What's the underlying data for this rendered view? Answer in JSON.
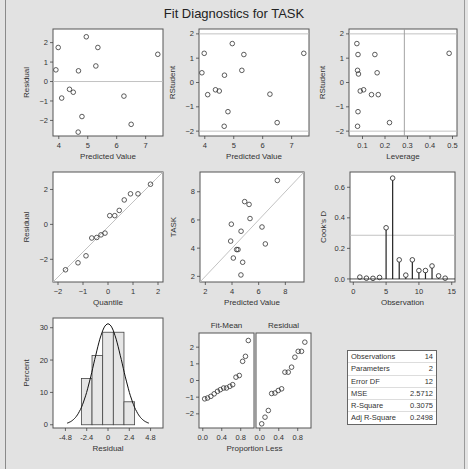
{
  "title": "Fit Diagnostics for TASK",
  "colors": {
    "background": "#e3e3e3",
    "plot_bg": "#ffffff",
    "marker": "#333333",
    "refline": "#bbbbbb"
  },
  "chart_data": [
    {
      "id": "resid_vs_pred",
      "type": "scatter",
      "xlabel": "Predicted Value",
      "ylabel": "Residual",
      "xlim": [
        3.8,
        7.6
      ],
      "ylim": [
        -2.8,
        2.7
      ],
      "xticks": [
        4,
        5,
        6,
        7
      ],
      "yticks": [
        -2,
        -1,
        0,
        1,
        2
      ],
      "reflines": [
        {
          "axis": "y",
          "value": 0
        }
      ],
      "x": [
        3.9,
        3.98,
        4.1,
        4.37,
        4.5,
        4.68,
        4.67,
        4.8,
        4.95,
        5.28,
        5.35,
        6.25,
        6.5,
        7.42
      ],
      "y": [
        0.6,
        1.75,
        -0.85,
        -0.4,
        -0.55,
        0.55,
        -2.6,
        -1.8,
        2.3,
        0.8,
        1.75,
        -0.75,
        -2.2,
        1.4
      ]
    },
    {
      "id": "rstudent_vs_pred",
      "type": "scatter",
      "xlabel": "Predicted Value",
      "ylabel": "RStudent",
      "xlim": [
        3.8,
        7.6
      ],
      "ylim": [
        -2.2,
        2.2
      ],
      "xticks": [
        4,
        5,
        6,
        7
      ],
      "yticks": [
        -2,
        -1,
        0,
        1,
        2
      ],
      "reflines": [
        {
          "axis": "y",
          "value": 2
        },
        {
          "axis": "y",
          "value": -2
        }
      ],
      "x": [
        3.9,
        3.98,
        4.1,
        4.37,
        4.5,
        4.68,
        4.67,
        4.8,
        4.95,
        5.28,
        5.35,
        6.25,
        6.5,
        7.42
      ],
      "y": [
        0.4,
        1.2,
        -0.5,
        -0.3,
        -0.35,
        0.3,
        -1.8,
        -1.2,
        1.6,
        0.5,
        1.15,
        -0.48,
        -1.65,
        1.2
      ]
    },
    {
      "id": "rstudent_vs_leverage",
      "type": "scatter",
      "xlabel": "Leverage",
      "ylabel": "RStudent",
      "xlim": [
        0.04,
        0.52
      ],
      "ylim": [
        -2.2,
        2.2
      ],
      "xticks": [
        0.1,
        0.2,
        0.3,
        0.4,
        0.5
      ],
      "xticklabels": [
        "0.1",
        "0.2",
        "0.3",
        "0.4",
        "0.5"
      ],
      "yticks": [
        -2,
        -1,
        0,
        1,
        2
      ],
      "reflines": [
        {
          "axis": "y",
          "value": 2
        },
        {
          "axis": "y",
          "value": -2
        },
        {
          "axis": "x",
          "value": 0.286
        }
      ],
      "x": [
        0.075,
        0.08,
        0.078,
        0.082,
        0.09,
        0.105,
        0.14,
        0.155,
        0.165,
        0.17,
        0.22,
        0.08,
        0.078,
        0.485
      ],
      "y": [
        1.6,
        1.15,
        0.5,
        0.35,
        -0.35,
        -0.3,
        -0.5,
        1.15,
        0.4,
        -0.5,
        -1.65,
        -1.2,
        -1.8,
        1.2
      ]
    },
    {
      "id": "qq_residual",
      "type": "scatter",
      "xlabel": "Quantile",
      "ylabel": "Residual",
      "xlim": [
        -2.2,
        2.2
      ],
      "ylim": [
        -3.3,
        3.0
      ],
      "xticks": [
        -2,
        -1,
        0,
        1,
        2
      ],
      "yticks": [
        -2,
        0,
        2
      ],
      "reflines": [
        {
          "type": "diagonal"
        }
      ],
      "x": [
        -1.7,
        -1.2,
        -0.88,
        -0.65,
        -0.45,
        -0.28,
        -0.12,
        0.07,
        0.27,
        0.45,
        0.65,
        0.9,
        1.2,
        1.7
      ],
      "y": [
        -2.6,
        -2.2,
        -1.8,
        -0.78,
        -0.75,
        -0.6,
        -0.5,
        0.5,
        0.5,
        0.8,
        1.4,
        1.75,
        1.75,
        2.3
      ]
    },
    {
      "id": "task_vs_pred",
      "type": "scatter",
      "xlabel": "Predicted Value",
      "ylabel": "TASK",
      "xlim": [
        1.6,
        9.4
      ],
      "ylim": [
        1.6,
        9.4
      ],
      "xticks": [
        2,
        4,
        6,
        8
      ],
      "yticks": [
        2,
        4,
        6,
        8
      ],
      "reflines": [
        {
          "type": "diagonal"
        }
      ],
      "x": [
        3.9,
        3.95,
        4.1,
        4.35,
        4.45,
        4.68,
        4.67,
        4.8,
        4.95,
        5.28,
        5.35,
        6.25,
        6.5,
        7.4
      ],
      "y": [
        4.5,
        5.7,
        3.3,
        3.9,
        3.9,
        5.2,
        2.1,
        3.0,
        7.3,
        7.1,
        6.1,
        5.5,
        4.3,
        8.8
      ]
    },
    {
      "id": "cooks_d",
      "type": "needle",
      "xlabel": "Observation",
      "ylabel": "Cook's D",
      "xlim": [
        -0.5,
        15.5
      ],
      "ylim": [
        -0.02,
        0.7
      ],
      "xticks": [
        0,
        5,
        10,
        15
      ],
      "yticks": [
        0.0,
        0.2,
        0.4,
        0.6
      ],
      "yticklabels": [
        "0.0",
        "0.2",
        "0.4",
        "0.6"
      ],
      "reflines": [
        {
          "axis": "y",
          "value": 0.286
        }
      ],
      "x": [
        1,
        2,
        3,
        4,
        5,
        6,
        7,
        8,
        9,
        10,
        11,
        12,
        13,
        14
      ],
      "y": [
        0.012,
        0.005,
        0.004,
        0.01,
        0.335,
        0.66,
        0.125,
        0.025,
        0.125,
        0.055,
        0.055,
        0.085,
        0.02,
        0.005
      ]
    },
    {
      "id": "residual_histogram",
      "type": "bar",
      "xlabel": "Residual",
      "ylabel": "Percent",
      "xlim": [
        -6.2,
        6.2
      ],
      "ylim": [
        -1,
        33
      ],
      "xticks": [
        -4.8,
        -2.4,
        0,
        2.4,
        4.8
      ],
      "xticklabels": [
        "-4.8",
        "-2.4",
        "0",
        "2.4",
        "4.8"
      ],
      "yticks": [
        0,
        10,
        20,
        30
      ],
      "bin_edges": [
        -3.0,
        -1.8,
        -0.6,
        0.6,
        1.8,
        3.0
      ],
      "values": [
        14.3,
        21.4,
        28.6,
        28.6,
        7.1
      ],
      "overlay": {
        "type": "normal_curve",
        "mean": 0,
        "sd": 1.6,
        "peak": 31.2
      }
    },
    {
      "id": "residual_fit_spread",
      "type": "scatter",
      "xlabel": "Proportion Less",
      "ylabel": "",
      "panels": [
        {
          "label": "Fit-Mean",
          "x": [
            0.04,
            0.1,
            0.17,
            0.24,
            0.31,
            0.37,
            0.44,
            0.5,
            0.57,
            0.63,
            0.7,
            0.77,
            0.84,
            0.9,
            0.96
          ],
          "y": [
            -1.1,
            -1.05,
            -0.95,
            -0.8,
            -0.65,
            -0.55,
            -0.45,
            -0.45,
            -0.35,
            -0.25,
            0.2,
            0.3,
            1.15,
            1.45,
            2.4
          ]
        },
        {
          "label": "Residual",
          "x": [
            0.04,
            0.11,
            0.18,
            0.25,
            0.32,
            0.39,
            0.46,
            0.53,
            0.6,
            0.67,
            0.74,
            0.81,
            0.88,
            0.95
          ],
          "y": [
            -2.6,
            -2.2,
            -1.8,
            -0.78,
            -0.75,
            -0.6,
            -0.5,
            0.5,
            0.5,
            0.8,
            1.4,
            1.75,
            1.75,
            2.3
          ]
        }
      ],
      "xlim": [
        -0.08,
        1.08
      ],
      "ylim": [
        -2.85,
        2.85
      ],
      "xticks": [
        0.0,
        0.4,
        0.8
      ],
      "xticklabels": [
        "0.0",
        "0.4",
        "0.8"
      ],
      "yticks": [
        -2,
        -1,
        0,
        1,
        2
      ]
    }
  ],
  "fit_statistics": [
    {
      "label": "Observations",
      "value": "14"
    },
    {
      "label": "Parameters",
      "value": "2"
    },
    {
      "label": "Error DF",
      "value": "12"
    },
    {
      "label": "MSE",
      "value": "2.5712"
    },
    {
      "label": "R-Square",
      "value": "0.3075"
    },
    {
      "label": "Adj R-Square",
      "value": "0.2498"
    }
  ]
}
